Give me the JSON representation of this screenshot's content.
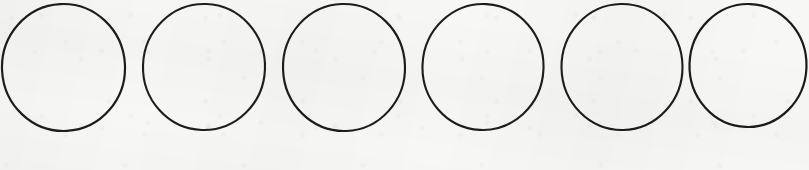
{
  "canvas": {
    "width": 809,
    "height": 170,
    "background_color": "#f7f7f6",
    "medium": "scanned paper"
  },
  "figure": {
    "shape_name": "circle",
    "shape_count": 6,
    "arrangement": "single horizontal row",
    "stroke_color": "#1c1c1c",
    "stroke_width": 2.1,
    "fill": "none"
  },
  "shapes": [
    {
      "index": 1,
      "label": "circle-1",
      "cx": 63.5,
      "cy": 67.5,
      "rx": 61.5,
      "ry": 63.5,
      "rotation": -3,
      "stroke_width": 2.2,
      "stroke_color": "#1c1c1c"
    },
    {
      "index": 2,
      "label": "circle-2",
      "cx": 204.0,
      "cy": 67.0,
      "rx": 61.0,
      "ry": 63.0,
      "rotation": 2,
      "stroke_width": 2.1,
      "stroke_color": "#1e1e1e"
    },
    {
      "index": 3,
      "label": "circle-3",
      "cx": 344.0,
      "cy": 67.5,
      "rx": 61.0,
      "ry": 63.5,
      "rotation": -2,
      "stroke_width": 2.15,
      "stroke_color": "#1c1c1c"
    },
    {
      "index": 4,
      "label": "circle-4",
      "cx": 483.0,
      "cy": 67.0,
      "rx": 60.5,
      "ry": 63.0,
      "rotation": 3,
      "stroke_width": 2.1,
      "stroke_color": "#1d1d1d"
    },
    {
      "index": 5,
      "label": "circle-5",
      "cx": 622.0,
      "cy": 67.0,
      "rx": 60.5,
      "ry": 63.0,
      "rotation": -1,
      "stroke_width": 2.1,
      "stroke_color": "#1c1c1c"
    },
    {
      "index": 6,
      "label": "circle-6",
      "cx": 748.0,
      "cy": 65.5,
      "rx": 58.5,
      "ry": 61.5,
      "rotation": 2,
      "stroke_width": 2.2,
      "stroke_color": "#1b1b1b"
    }
  ]
}
